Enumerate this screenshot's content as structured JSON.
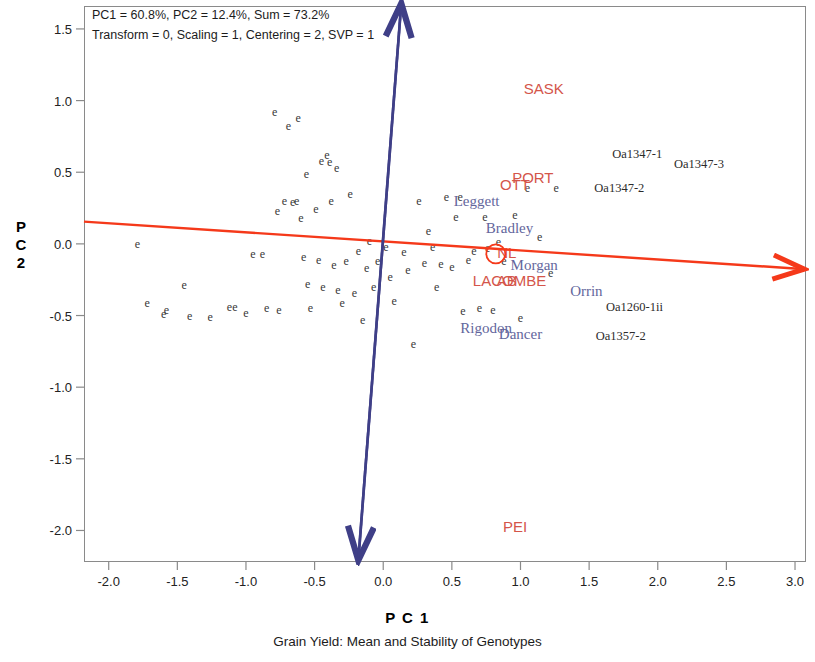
{
  "header": {
    "line1": "PC1 = 60.8%, PC2 = 12.4%, Sum = 73.2%",
    "line2": "Transform = 0, Scaling = 1, Centering = 2, SVP = 1"
  },
  "axes": {
    "x_title": "P C 1",
    "y_title_chars": [
      "P",
      "C",
      "2"
    ],
    "caption": "Grain Yield: Mean and Stability of Genotypes"
  },
  "colors": {
    "env_label": "#d4554a",
    "genotype_label": "#63669c",
    "code_label": "#2b2b2b",
    "axis_arrow_red": "#f5391a",
    "axis_arrow_blue": "#3f3f87",
    "point_marker": "#3a3a3a",
    "frame": "#8a8a8a"
  },
  "chart_data": {
    "type": "scatter",
    "title": "Grain Yield: Mean and Stability of Genotypes",
    "subtitle": "PC1 = 60.8%, PC2 = 12.4%, Sum = 73.2%",
    "annotation": "Transform = 0, Scaling = 1, Centering = 2, SVP = 1",
    "xlabel": "P C 1",
    "ylabel": "P C 2",
    "xlim": [
      -2.18,
      3.08
    ],
    "ylim": [
      -2.22,
      1.66
    ],
    "grid": false,
    "legend": null,
    "xticks": [
      "-2.0",
      "-1.5",
      "-1.0",
      "-0.5",
      "0.0",
      "0.5",
      "1.0",
      "1.5",
      "2.0",
      "2.5",
      "3.0"
    ],
    "xtick_values": [
      -2.0,
      -1.5,
      -1.0,
      -0.5,
      0.0,
      0.5,
      1.0,
      1.5,
      2.0,
      2.5,
      3.0
    ],
    "yticks": [
      "1.5",
      "1.0",
      "0.5",
      "0.0",
      "-0.5",
      "-1.0",
      "-1.5",
      "-2.0"
    ],
    "ytick_values": [
      1.5,
      1.0,
      0.5,
      0.0,
      -0.5,
      -1.0,
      -1.5,
      -2.0
    ],
    "variance_explained": {
      "PC1": 60.8,
      "PC2": 12.4,
      "sum": 73.2
    },
    "parameters": {
      "Transform": 0,
      "Scaling": 1,
      "Centering": 2,
      "SVP": 1
    },
    "mean_axis_line": {
      "name": "average-environment-axis",
      "color": "#f5391a",
      "arrow": "single",
      "x1": -2.18,
      "y1": 0.155,
      "x2": 3.05,
      "y2": -0.175
    },
    "stability_axis_line": {
      "name": "stability-axis",
      "color": "#3f3f87",
      "arrow": "double",
      "x1": 0.13,
      "y1": 1.66,
      "x2": -0.18,
      "y2": -2.19
    },
    "origin_marker": {
      "x": 0.82,
      "y": -0.07,
      "shape": "circle",
      "color": "#f5391a"
    },
    "environments": [
      {
        "label": "SASK",
        "x": 1.17,
        "y": 1.09
      },
      {
        "label": "PORT",
        "x": 1.09,
        "y": 0.47
      },
      {
        "label": "OTT",
        "x": 0.96,
        "y": 0.42
      },
      {
        "label": "NL",
        "x": 0.9,
        "y": -0.06
      },
      {
        "label": "LACOMBE",
        "x": 0.92,
        "y": -0.25
      },
      {
        "label": "AB",
        "x": 0.9,
        "y": -0.25
      },
      {
        "label": "PEI",
        "x": 0.96,
        "y": -1.97
      }
    ],
    "genotypes": [
      {
        "label": "Leggett",
        "x": 0.68,
        "y": 0.3
      },
      {
        "label": "Bradley",
        "x": 0.92,
        "y": 0.11
      },
      {
        "label": "Morgan",
        "x": 1.1,
        "y": -0.15
      },
      {
        "label": "Orrin",
        "x": 1.48,
        "y": -0.33
      },
      {
        "label": "Rigodon",
        "x": 0.75,
        "y": -0.59
      },
      {
        "label": "Dancer",
        "x": 1.0,
        "y": -0.63
      }
    ],
    "genotype_codes": [
      {
        "label": "Oa1347-1",
        "x": 1.85,
        "y": 0.63
      },
      {
        "label": "Oa1347-3",
        "x": 2.3,
        "y": 0.56
      },
      {
        "label": "Oa1347-2",
        "x": 1.72,
        "y": 0.39
      },
      {
        "label": "Oa1260-1ii",
        "x": 1.83,
        "y": -0.44
      },
      {
        "label": "Oa1357-2",
        "x": 1.73,
        "y": -0.64
      }
    ],
    "point_marker_glyph": "e",
    "points": [
      {
        "x": -1.79,
        "y": 0.0
      },
      {
        "x": -1.72,
        "y": -0.41
      },
      {
        "x": -1.6,
        "y": -0.49
      },
      {
        "x": -1.45,
        "y": -0.29
      },
      {
        "x": -1.41,
        "y": -0.5
      },
      {
        "x": -1.26,
        "y": -0.51
      },
      {
        "x": -1.12,
        "y": -0.44
      },
      {
        "x": -1.08,
        "y": -0.44
      },
      {
        "x": -1.0,
        "y": -0.48
      },
      {
        "x": -0.95,
        "y": -0.07
      },
      {
        "x": -0.88,
        "y": -0.07
      },
      {
        "x": -0.85,
        "y": -0.45
      },
      {
        "x": -0.79,
        "y": 0.92
      },
      {
        "x": -0.77,
        "y": 0.23
      },
      {
        "x": -0.76,
        "y": -0.46
      },
      {
        "x": -0.72,
        "y": 0.3
      },
      {
        "x": -0.69,
        "y": 0.82
      },
      {
        "x": -0.66,
        "y": 0.29
      },
      {
        "x": -0.63,
        "y": 0.3
      },
      {
        "x": -0.62,
        "y": 0.88
      },
      {
        "x": -0.6,
        "y": 0.18
      },
      {
        "x": -0.58,
        "y": -0.09
      },
      {
        "x": -0.56,
        "y": 0.49
      },
      {
        "x": -0.55,
        "y": -0.28
      },
      {
        "x": -0.53,
        "y": -0.45
      },
      {
        "x": -0.49,
        "y": 0.24
      },
      {
        "x": -0.47,
        "y": -0.11
      },
      {
        "x": -0.45,
        "y": 0.58
      },
      {
        "x": -0.44,
        "y": -0.3
      },
      {
        "x": -0.41,
        "y": 0.62
      },
      {
        "x": -0.39,
        "y": 0.57
      },
      {
        "x": -0.38,
        "y": 0.3
      },
      {
        "x": -0.36,
        "y": -0.15
      },
      {
        "x": -0.34,
        "y": 0.53
      },
      {
        "x": -0.33,
        "y": -0.32
      },
      {
        "x": -0.3,
        "y": -0.41
      },
      {
        "x": -0.27,
        "y": -0.12
      },
      {
        "x": -0.24,
        "y": 0.35
      },
      {
        "x": -0.21,
        "y": -0.34
      },
      {
        "x": -0.18,
        "y": -0.05
      },
      {
        "x": -0.15,
        "y": -0.53
      },
      {
        "x": -0.12,
        "y": -0.17
      },
      {
        "x": -0.1,
        "y": 0.02
      },
      {
        "x": -0.07,
        "y": -0.3
      },
      {
        "x": -0.04,
        "y": -0.12
      },
      {
        "x": 0.02,
        "y": -0.02
      },
      {
        "x": 0.05,
        "y": -0.23
      },
      {
        "x": 0.08,
        "y": -0.4
      },
      {
        "x": 0.15,
        "y": -0.06
      },
      {
        "x": 0.18,
        "y": -0.18
      },
      {
        "x": 0.22,
        "y": -0.7
      },
      {
        "x": 0.26,
        "y": 0.3
      },
      {
        "x": 0.3,
        "y": -0.13
      },
      {
        "x": 0.33,
        "y": 0.09
      },
      {
        "x": 0.36,
        "y": -0.02
      },
      {
        "x": 0.39,
        "y": -0.3
      },
      {
        "x": 0.42,
        "y": -0.14
      },
      {
        "x": 0.46,
        "y": 0.33
      },
      {
        "x": 0.5,
        "y": -0.16
      },
      {
        "x": 0.53,
        "y": 0.19
      },
      {
        "x": 0.56,
        "y": 0.33
      },
      {
        "x": 0.58,
        "y": -0.47
      },
      {
        "x": 0.62,
        "y": -0.11
      },
      {
        "x": 0.66,
        "y": -0.05
      },
      {
        "x": 0.7,
        "y": -0.45
      },
      {
        "x": 0.74,
        "y": 0.19
      },
      {
        "x": 0.76,
        "y": -0.03
      },
      {
        "x": 0.8,
        "y": -0.46
      },
      {
        "x": 0.84,
        "y": 0.01
      },
      {
        "x": 0.88,
        "y": -0.12
      },
      {
        "x": 0.96,
        "y": 0.2
      },
      {
        "x": 1.0,
        "y": -0.52
      },
      {
        "x": 1.05,
        "y": 0.39
      },
      {
        "x": 1.14,
        "y": 0.05
      },
      {
        "x": 1.22,
        "y": -0.2
      },
      {
        "x": 1.26,
        "y": 0.39
      },
      {
        "x": -1.58,
        "y": -0.46
      }
    ]
  }
}
